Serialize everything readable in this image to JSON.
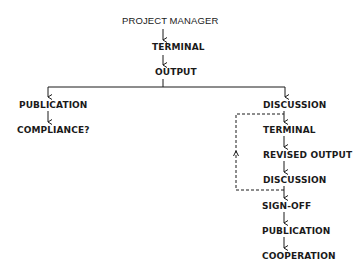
{
  "diagram": {
    "root": {
      "label": "PROJECT MANAGER"
    },
    "trunk": [
      {
        "label": "TERMINAL"
      },
      {
        "label": "OUTPUT"
      }
    ],
    "left_branch": [
      {
        "label": "PUBLICATION"
      },
      {
        "label": "COMPLIANCE?"
      }
    ],
    "right_branch": [
      {
        "label": "DISCUSSION"
      },
      {
        "label": "TERMINAL"
      },
      {
        "label": "REVISED OUTPUT"
      },
      {
        "label": "DISCUSSION"
      },
      {
        "label": "SIGN-OFF"
      },
      {
        "label": "PUBLICATION"
      },
      {
        "label": "COOPERATION"
      }
    ],
    "feedback_loop": {
      "style": "dashed",
      "from": "DISCUSSION (after REVISED OUTPUT)",
      "to": "TERMINAL (right branch)"
    },
    "line_color": "#1a1a1a"
  }
}
